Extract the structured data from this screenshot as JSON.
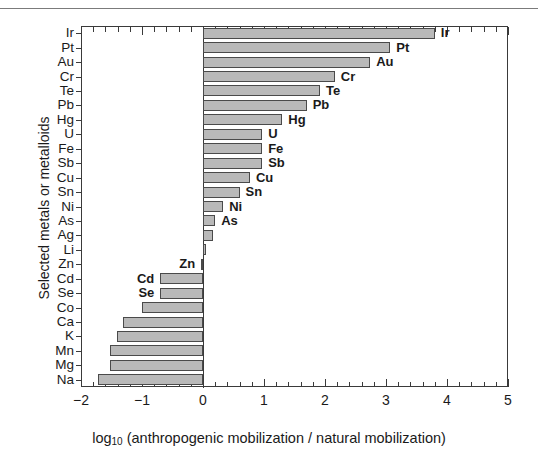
{
  "chart_data": {
    "type": "bar",
    "orientation": "horizontal",
    "title": "",
    "xlabel": "log10 (anthropogenic mobilization / natural mobilization)",
    "xlabel_base": "log",
    "xlabel_sub": "10",
    "xlabel_rest": " (anthropogenic mobilization / natural mobilization)",
    "ylabel": "Selected metals or metalloids",
    "xlim": [
      -2,
      5
    ],
    "ylim_categories": 25,
    "grid": false,
    "legend": false,
    "xticks": [
      -2,
      -1,
      0,
      1,
      2,
      3,
      4,
      5
    ],
    "xtick_labels": [
      "−2",
      "−1",
      "0",
      "1",
      "2",
      "3",
      "4",
      "5"
    ],
    "minor_tick_interval": 0.2,
    "bar_color": "#b9b9b9",
    "bar_edge_color": "#4a4a4a",
    "categories": [
      "Ir",
      "Pt",
      "Au",
      "Cr",
      "Te",
      "Pb",
      "Hg",
      "U",
      "Fe",
      "Sb",
      "Cu",
      "Sn",
      "Ni",
      "As",
      "Ag",
      "Li",
      "Zn",
      "Cd",
      "Se",
      "Co",
      "Ca",
      "K",
      "Mn",
      "Mg",
      "Na"
    ],
    "values": [
      3.8,
      3.07,
      2.74,
      2.16,
      1.92,
      1.7,
      1.3,
      0.97,
      0.97,
      0.97,
      0.77,
      0.6,
      0.33,
      0.2,
      0.17,
      0.05,
      -0.03,
      -0.7,
      -0.7,
      -1.0,
      -1.31,
      -1.41,
      -1.52,
      -1.52,
      -1.72
    ],
    "annotated_bars": [
      "Ir",
      "Pt",
      "Au",
      "Cr",
      "Te",
      "Pb",
      "Hg",
      "U",
      "Fe",
      "Sb",
      "Cu",
      "Sn",
      "Ni",
      "As",
      "Zn",
      "Cd",
      "Se"
    ],
    "data_label_side": {
      "Ir": "right",
      "Pt": "right",
      "Au": "right",
      "Cr": "right",
      "Te": "right",
      "Pb": "right",
      "Hg": "right",
      "U": "right",
      "Fe": "right",
      "Sb": "right",
      "Cu": "right",
      "Sn": "right",
      "Ni": "right",
      "As": "right",
      "Zn": "left",
      "Cd": "left",
      "Se": "left"
    }
  }
}
